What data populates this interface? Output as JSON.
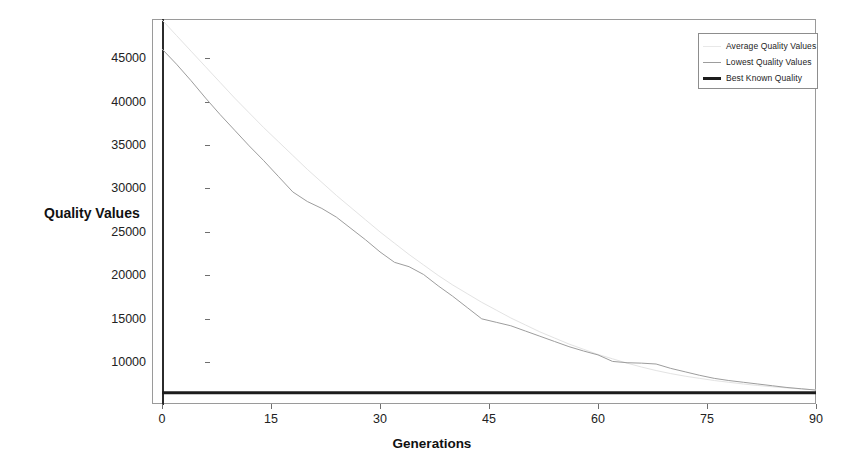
{
  "chart_data": {
    "type": "line",
    "title": "",
    "xlabel": "Generations",
    "ylabel": "Quality Values",
    "xlim": [
      0,
      90
    ],
    "ylim": [
      5200,
      49500
    ],
    "grid": false,
    "legend_position": "top-right",
    "xticks": [
      0,
      15,
      30,
      45,
      60,
      75,
      90
    ],
    "xtick_labels": [
      "0",
      "15",
      "30",
      "45",
      "60",
      "75",
      "90"
    ],
    "yticks": [
      10000,
      15000,
      20000,
      25000,
      30000,
      35000,
      40000,
      45000
    ],
    "ytick_labels": [
      "10000",
      "15000",
      "20000",
      "25000",
      "30000",
      "35000",
      "40000",
      "45000"
    ],
    "x": [
      0,
      2,
      4,
      6,
      8,
      10,
      12,
      14,
      16,
      18,
      20,
      22,
      24,
      26,
      28,
      30,
      32,
      34,
      36,
      38,
      40,
      42,
      44,
      46,
      48,
      50,
      52,
      54,
      56,
      58,
      60,
      62,
      64,
      66,
      68,
      70,
      72,
      74,
      76,
      78,
      80,
      82,
      84,
      86,
      88,
      90
    ],
    "series": [
      {
        "name": "Average Quality Values",
        "color": "#e3e3e3",
        "width": 1,
        "values": [
          49400,
          47600,
          45800,
          44000,
          42200,
          40400,
          38700,
          37000,
          35400,
          33800,
          32200,
          30700,
          29200,
          27800,
          26400,
          25000,
          23700,
          22400,
          21200,
          20000,
          18900,
          17900,
          16900,
          16000,
          15100,
          14300,
          13500,
          12800,
          12100,
          11500,
          10900,
          10400,
          9900,
          9450,
          9050,
          8700,
          8400,
          8150,
          7900,
          7700,
          7500,
          7330,
          7180,
          7050,
          6930,
          6820
        ]
      },
      {
        "name": "Lowest Quality Values",
        "color": "#9d9d9d",
        "width": 1,
        "values": [
          46050,
          44300,
          42400,
          40400,
          38500,
          36700,
          34900,
          33200,
          31400,
          29600,
          28500,
          27700,
          26700,
          25400,
          24100,
          22700,
          21500,
          21000,
          20100,
          18800,
          17600,
          16300,
          15000,
          14600,
          14200,
          13600,
          13000,
          12400,
          11800,
          11300,
          10850,
          10100,
          9950,
          9900,
          9800,
          9300,
          8900,
          8500,
          8150,
          7900,
          7700,
          7500,
          7300,
          7100,
          6950,
          6800
        ]
      },
      {
        "name": "Best Known Quality",
        "color": "#1c1c1c",
        "width": 3,
        "values": [
          6500,
          6500,
          6500,
          6500,
          6500,
          6500,
          6500,
          6500,
          6500,
          6500,
          6500,
          6500,
          6500,
          6500,
          6500,
          6500,
          6500,
          6500,
          6500,
          6500,
          6500,
          6500,
          6500,
          6500,
          6500,
          6500,
          6500,
          6500,
          6500,
          6500,
          6500,
          6500,
          6500,
          6500,
          6500,
          6500,
          6500,
          6500,
          6500,
          6500,
          6500,
          6500,
          6500,
          6500,
          6500,
          6500
        ]
      }
    ]
  },
  "legend": {
    "entries": [
      {
        "label": "Average Quality Values",
        "swatch": "line-light-gray"
      },
      {
        "label": "Lowest Quality Values",
        "swatch": "line-gray"
      },
      {
        "label": "Best Known Quality",
        "swatch": "line-thick-black"
      }
    ]
  },
  "axes": {
    "x_title": "Generations",
    "y_title": "Quality Values"
  }
}
